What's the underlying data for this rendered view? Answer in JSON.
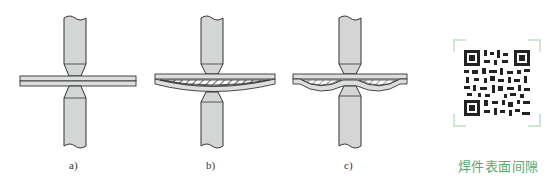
{
  "figure": {
    "panels": [
      {
        "id": "a",
        "label": "a)",
        "description": "Electrodes clamping two flat sheets with no gap"
      },
      {
        "id": "b",
        "label": "b)",
        "description": "Sheets with a single lens-shaped gap between them (hatched)"
      },
      {
        "id": "c",
        "label": "c)",
        "description": "Sheets with two gaps on either side of the weld point (hatched)"
      }
    ],
    "qr_code": {
      "caption": "焊件表面间隙"
    },
    "colors": {
      "electrode_fill": "#d4d6d6",
      "plate_fill": "#dcdede",
      "stroke": "#333333",
      "caption": "#5aa86a",
      "qr_frame": "#cfe6d2"
    }
  }
}
